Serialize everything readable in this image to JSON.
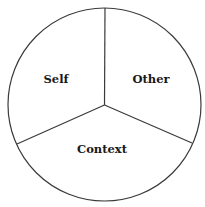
{
  "diagram": {
    "type": "three-sector circle",
    "sectors": [
      {
        "label": "Self"
      },
      {
        "label": "Other"
      },
      {
        "label": "Context"
      }
    ],
    "colors": {
      "stroke": "#3a3a3a",
      "fill": "#ffffff",
      "text": "#1a1a1a"
    }
  }
}
